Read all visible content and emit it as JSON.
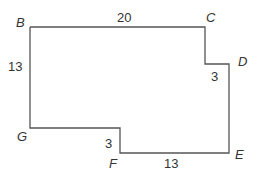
{
  "diagram": {
    "type": "rectilinear polygon",
    "stroke_color": "#555555",
    "vertices": {
      "B": "B",
      "C": "C",
      "D": "D",
      "E": "E",
      "F": "F",
      "G": "G"
    },
    "measurements": {
      "BC": "20",
      "BG": "13",
      "CD_step": "3",
      "GF_step": "3",
      "FE": "13"
    }
  }
}
